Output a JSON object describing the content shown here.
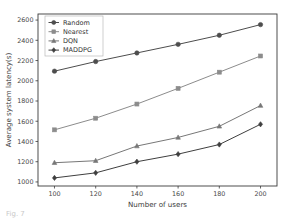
{
  "figure": {
    "background_color": "#ffffff",
    "caption_fragment": "Fig. 7"
  },
  "chart_data": {
    "type": "line",
    "title": "",
    "xlabel": "Number of users",
    "ylabel": "Average system latency(s)",
    "x": [
      100,
      120,
      140,
      160,
      180,
      200
    ],
    "xticklabels": [
      "100",
      "120",
      "140",
      "160",
      "180",
      "200"
    ],
    "yticklabels": [
      "1000",
      "1200",
      "1400",
      "1600",
      "1800",
      "2000",
      "2200",
      "2400",
      "2600"
    ],
    "yticks": [
      1000,
      1200,
      1400,
      1600,
      1800,
      2000,
      2200,
      2400,
      2600
    ],
    "xlim": [
      92,
      208
    ],
    "ylim": [
      960,
      2660
    ],
    "grid": false,
    "legend_position": "upper left",
    "series": [
      {
        "name": "Random",
        "marker": "circle",
        "color": "#4d4d4d",
        "values": [
          2095,
          2190,
          2275,
          2360,
          2450,
          2555
        ]
      },
      {
        "name": "Nearest",
        "marker": "square",
        "color": "#8c8c8c",
        "values": [
          1515,
          1630,
          1770,
          1925,
          2085,
          2245
        ]
      },
      {
        "name": "DQN",
        "marker": "triangle",
        "color": "#777777",
        "values": [
          1190,
          1210,
          1355,
          1440,
          1550,
          1755
        ]
      },
      {
        "name": "MADDPG",
        "marker": "diamond",
        "color": "#3f3f3f",
        "values": [
          1040,
          1090,
          1200,
          1275,
          1370,
          1570
        ]
      }
    ]
  },
  "legend": {
    "entries": [
      {
        "label": "Random"
      },
      {
        "label": "Nearest"
      },
      {
        "label": "DQN"
      },
      {
        "label": "MADDPG"
      }
    ]
  }
}
